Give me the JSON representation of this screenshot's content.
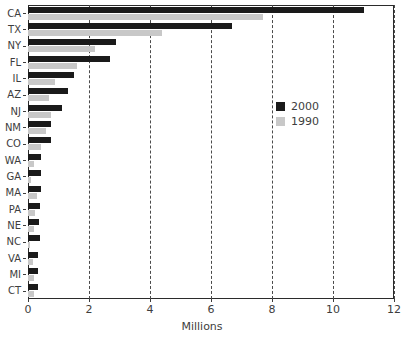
{
  "chart_data": {
    "type": "bar",
    "orientation": "horizontal",
    "title": "",
    "xlabel": "Millions",
    "ylabel": "",
    "xlim": [
      0,
      12
    ],
    "xticks": [
      0,
      2,
      4,
      6,
      8,
      10,
      12
    ],
    "xtick_labels": [
      "0",
      "2",
      "4",
      "6",
      "8",
      "10",
      "12"
    ],
    "grid": true,
    "grid_axis": "x",
    "grid_style": "dashed",
    "legend_position": "center-right",
    "categories": [
      "CA",
      "TX",
      "NY",
      "FL",
      "IL",
      "AZ",
      "NJ",
      "NM",
      "CO",
      "WA",
      "GA",
      "MA",
      "PA",
      "NE",
      "NC",
      "VA",
      "MI",
      "CT"
    ],
    "series": [
      {
        "name": "2000",
        "color": "#1a1a1a",
        "values": [
          11.0,
          6.7,
          2.9,
          2.7,
          1.5,
          1.3,
          1.1,
          0.77,
          0.74,
          0.44,
          0.44,
          0.43,
          0.39,
          0.36,
          0.38,
          0.33,
          0.32,
          0.32
        ]
      },
      {
        "name": "1990",
        "color": "#c8c8c8",
        "values": [
          7.7,
          4.4,
          2.2,
          1.6,
          0.9,
          0.69,
          0.74,
          0.58,
          0.42,
          0.21,
          0.11,
          0.29,
          0.23,
          0.19,
          0.08,
          0.16,
          0.2,
          0.21
        ]
      }
    ]
  },
  "legend": {
    "entries": [
      {
        "label": "2000",
        "color": "#1a1a1a"
      },
      {
        "label": "1990",
        "color": "#c8c8c8"
      }
    ]
  }
}
